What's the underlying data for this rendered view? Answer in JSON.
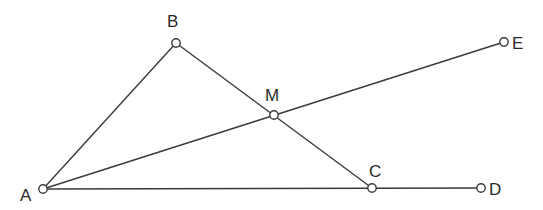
{
  "diagram": {
    "type": "geometry",
    "colors": {
      "stroke": "#3a3a3a",
      "point_fill": "#ffffff",
      "label": "#2a2a2a",
      "background": "#ffffff"
    },
    "points": [
      {
        "id": "A",
        "label": "A",
        "x": 43,
        "y": 189,
        "label_x": 20,
        "label_y": 201
      },
      {
        "id": "B",
        "label": "B",
        "x": 176,
        "y": 43,
        "label_x": 167,
        "label_y": 27
      },
      {
        "id": "M",
        "label": "M",
        "x": 274,
        "y": 115,
        "label_x": 265,
        "label_y": 101
      },
      {
        "id": "C",
        "label": "C",
        "x": 372,
        "y": 188,
        "label_x": 369,
        "label_y": 177
      },
      {
        "id": "D",
        "label": "D",
        "x": 481,
        "y": 188,
        "label_x": 489,
        "label_y": 195
      },
      {
        "id": "E",
        "label": "E",
        "x": 504,
        "y": 42,
        "label_x": 512,
        "label_y": 49
      }
    ],
    "segments": [
      {
        "from": "A",
        "to": "B"
      },
      {
        "from": "B",
        "to": "C"
      },
      {
        "from": "A",
        "to": "E"
      },
      {
        "from": "A",
        "to": "D"
      }
    ]
  }
}
